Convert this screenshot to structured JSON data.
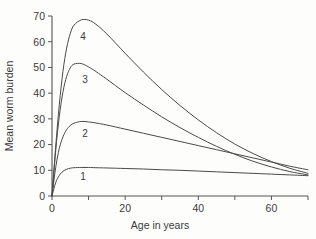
{
  "chart_data": {
    "type": "line",
    "title": "",
    "xlabel": "Age in years",
    "ylabel": "Mean worm burden",
    "xlim": [
      0,
      70
    ],
    "ylim": [
      0,
      70
    ],
    "grid": false,
    "legend": "inline-curve-labels",
    "x_ticks": [
      0,
      10,
      20,
      30,
      40,
      50,
      60,
      70
    ],
    "x_tick_labels": [
      "0",
      "",
      "20",
      "",
      "40",
      "",
      "60",
      ""
    ],
    "y_ticks": [
      0,
      10,
      20,
      30,
      40,
      50,
      60,
      70
    ],
    "y_tick_labels": [
      "0",
      "10",
      "20",
      "30",
      "40",
      "50",
      "60",
      "70"
    ],
    "x": [
      0,
      1,
      2,
      3,
      4,
      5,
      6,
      8,
      10,
      12,
      15,
      20,
      25,
      30,
      35,
      40,
      45,
      50,
      55,
      60,
      65,
      70
    ],
    "series": [
      {
        "name": "1",
        "label": "1",
        "label_x": 8.5,
        "label_y": 7.5,
        "values": [
          0,
          5.2,
          8.0,
          9.6,
          10.4,
          10.8,
          11.0,
          11.1,
          11.1,
          11.0,
          10.9,
          10.7,
          10.5,
          10.2,
          10.0,
          9.7,
          9.4,
          9.1,
          8.8,
          8.5,
          8.2,
          7.9
        ]
      },
      {
        "name": "2",
        "label": "2",
        "label_x": 9.0,
        "label_y": 24.5,
        "values": [
          0,
          11.0,
          18.5,
          23.0,
          25.8,
          27.4,
          28.3,
          29.0,
          28.8,
          28.4,
          27.6,
          26.0,
          24.4,
          22.8,
          21.2,
          19.6,
          18.0,
          16.4,
          14.8,
          13.2,
          11.6,
          10.2
        ]
      },
      {
        "name": "3",
        "label": "3",
        "label_x": 9.0,
        "label_y": 45.5,
        "values": [
          0,
          17.5,
          31.0,
          40.5,
          46.5,
          49.8,
          51.3,
          51.5,
          50.2,
          48.4,
          45.4,
          40.2,
          35.4,
          30.8,
          26.6,
          22.8,
          19.3,
          16.2,
          13.5,
          11.3,
          9.5,
          8.2
        ]
      },
      {
        "name": "4",
        "label": "4",
        "label_x": 8.5,
        "label_y": 62.0,
        "values": [
          0,
          19.0,
          35.5,
          48.5,
          57.5,
          63.2,
          66.4,
          68.5,
          68.4,
          66.8,
          63.0,
          55.5,
          48.2,
          41.4,
          35.2,
          29.6,
          24.6,
          20.2,
          16.5,
          13.4,
          10.8,
          8.8
        ]
      }
    ]
  }
}
